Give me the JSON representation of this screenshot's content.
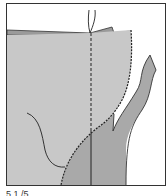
{
  "figure": {
    "colors": {
      "background": "#ffffff",
      "frame": "#333333",
      "light_piece": "#c8c8c8",
      "dark_piece": "#a9a9a9",
      "top_strip": "#9a9a9a",
      "line": "#222222"
    }
  },
  "caption": {
    "text": "5.1 /5 ...",
    "truncated": true
  }
}
